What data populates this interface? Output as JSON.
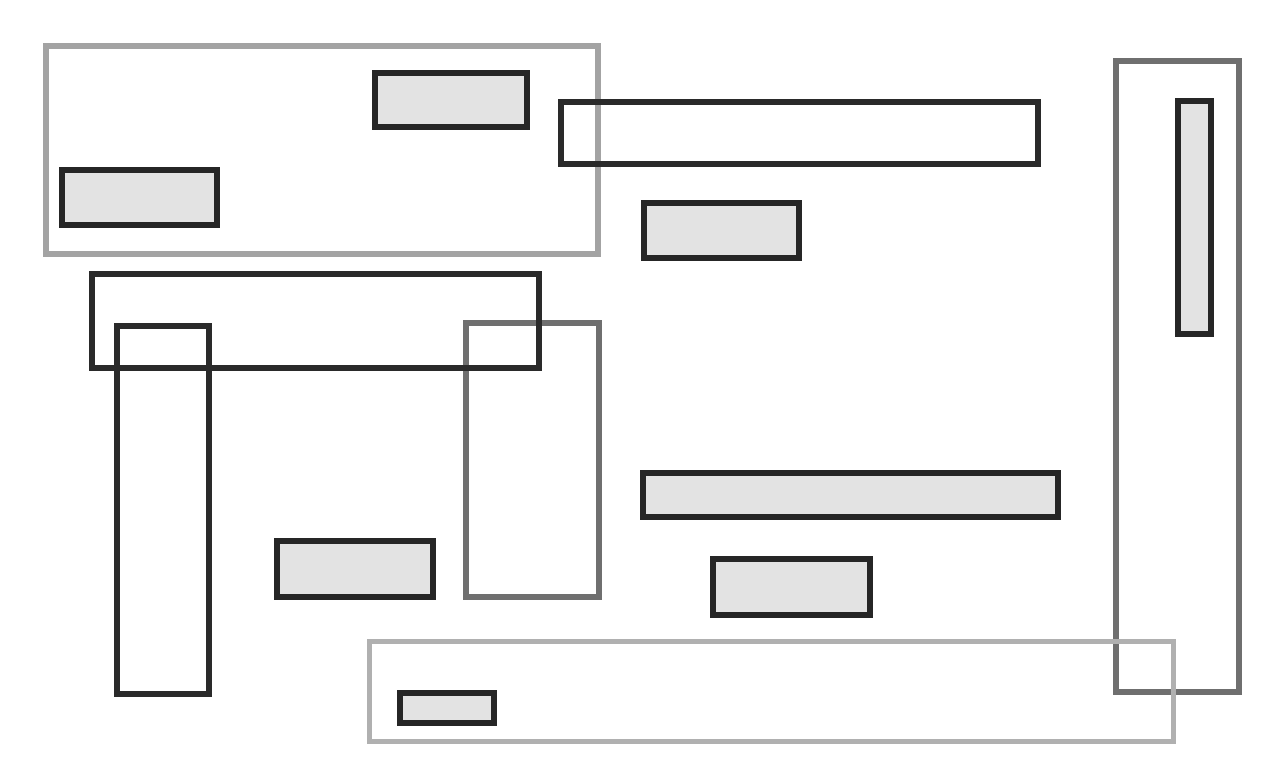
{
  "diagram": {
    "background": "#ffffff",
    "colors": {
      "container_light": "#a3a3a3",
      "container_bottom": "#b0b0b0",
      "container_mid": "#6f6f6f",
      "outline_dark": "#2a2a2a",
      "filled_border": "#262626",
      "filled_fill": "#e3e3e3"
    },
    "containers": [
      {
        "id": "top-left-container",
        "x": 43,
        "y": 43,
        "w": 558,
        "h": 214,
        "style": "light"
      },
      {
        "id": "right-vertical-container",
        "x": 1113,
        "y": 58,
        "w": 129,
        "h": 637,
        "style": "mid"
      },
      {
        "id": "middle-vertical-container",
        "x": 463,
        "y": 320,
        "w": 139,
        "h": 280,
        "style": "mid"
      },
      {
        "id": "bottom-container",
        "x": 367,
        "y": 639,
        "w": 809,
        "h": 105,
        "style": "bottom"
      }
    ],
    "outlines": [
      {
        "id": "top-horizontal-outline",
        "x": 558,
        "y": 99,
        "w": 483,
        "h": 68
      },
      {
        "id": "left-horizontal-outline",
        "x": 89,
        "y": 271,
        "w": 453,
        "h": 100
      },
      {
        "id": "left-vertical-outline",
        "x": 114,
        "y": 323,
        "w": 98,
        "h": 374
      }
    ],
    "filled": [
      {
        "id": "filled-a",
        "x": 372,
        "y": 70,
        "w": 158,
        "h": 60
      },
      {
        "id": "filled-b",
        "x": 59,
        "y": 167,
        "w": 161,
        "h": 61
      },
      {
        "id": "filled-c",
        "x": 641,
        "y": 200,
        "w": 161,
        "h": 61
      },
      {
        "id": "filled-d",
        "x": 1175,
        "y": 98,
        "w": 39,
        "h": 239
      },
      {
        "id": "filled-e",
        "x": 274,
        "y": 538,
        "w": 162,
        "h": 62
      },
      {
        "id": "filled-f",
        "x": 640,
        "y": 470,
        "w": 421,
        "h": 50
      },
      {
        "id": "filled-g",
        "x": 710,
        "y": 556,
        "w": 163,
        "h": 62
      },
      {
        "id": "filled-h",
        "x": 397,
        "y": 690,
        "w": 100,
        "h": 36
      }
    ]
  }
}
